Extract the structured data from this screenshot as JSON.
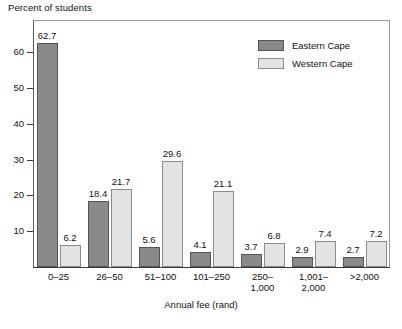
{
  "chart_data": {
    "type": "bar",
    "title": "Percent of students",
    "xlabel": "Annual fee (rand)",
    "ylabel": "",
    "ylim": [
      0,
      69
    ],
    "yticks": [
      10,
      20,
      30,
      40,
      50,
      60
    ],
    "grid": false,
    "legend_position": "top-right",
    "categories": [
      {
        "line1": "0–25",
        "line2": ""
      },
      {
        "line1": "26–50",
        "line2": ""
      },
      {
        "line1": "51–100",
        "line2": ""
      },
      {
        "line1": "101–250",
        "line2": ""
      },
      {
        "line1": "250–",
        "line2": "1,000"
      },
      {
        "line1": "1,001–",
        "line2": "2,000"
      },
      {
        "line1": ">2,000",
        "line2": ""
      }
    ],
    "series": [
      {
        "name": "Eastern Cape",
        "color": "#8a8a8a",
        "values": [
          62.7,
          18.4,
          5.6,
          4.1,
          3.7,
          2.9,
          2.7
        ],
        "labels": [
          "62.7",
          "18.4",
          "5.6",
          "4.1",
          "3.7",
          "2.9",
          "2.7"
        ]
      },
      {
        "name": "Western Cape",
        "color": "#e3e3e3",
        "values": [
          6.2,
          21.7,
          29.6,
          21.1,
          6.8,
          7.4,
          7.2
        ],
        "labels": [
          "6.2",
          "21.7",
          "29.6",
          "21.1",
          "6.8",
          "7.4",
          "7.2"
        ]
      }
    ]
  }
}
